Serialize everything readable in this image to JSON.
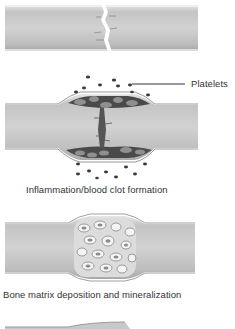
{
  "diagram": {
    "stages": [
      {
        "id": "fracture",
        "caption": ""
      },
      {
        "id": "inflammation",
        "caption": "Inflammation/blood clot formation",
        "callout": "Platelets"
      },
      {
        "id": "matrix",
        "caption": "Bone matrix deposition and mineralization"
      },
      {
        "id": "remodeling",
        "caption": ""
      }
    ],
    "colors": {
      "bone_fill": "#b9b9b9",
      "bone_light": "#d9d9d9",
      "bone_edge": "#8c8c8c",
      "clot": "#4a4a4a",
      "platelet": "#3a3a3a",
      "background": "#ffffff"
    }
  }
}
